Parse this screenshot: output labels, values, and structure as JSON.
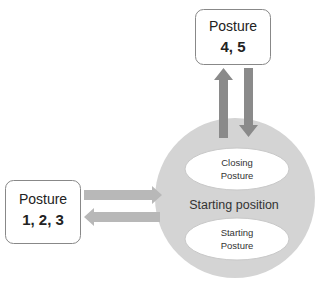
{
  "diagram": {
    "top_box": {
      "title": "Posture",
      "numbers": "4, 5"
    },
    "left_box": {
      "title": "Posture",
      "numbers": "1, 2, 3"
    },
    "center_circle": {
      "label": "Starting position",
      "upper_ellipse": {
        "line1": "Closing",
        "line2": "Posture"
      },
      "lower_ellipse": {
        "line1": "Starting",
        "line2": "Posture"
      }
    },
    "arrows": [
      {
        "from": "center_circle",
        "to": "top_box",
        "direction": "up"
      },
      {
        "from": "top_box",
        "to": "center_circle",
        "direction": "down"
      },
      {
        "from": "left_box",
        "to": "center_circle",
        "direction": "right"
      },
      {
        "from": "center_circle",
        "to": "left_box",
        "direction": "left"
      }
    ],
    "colors": {
      "circle_fill": "#d4d4d4",
      "ellipse_fill": "#ffffff",
      "vertical_arrows": "#8a8a8a",
      "horizontal_arrows": "#b8b8b8",
      "box_border": "#888888"
    }
  }
}
